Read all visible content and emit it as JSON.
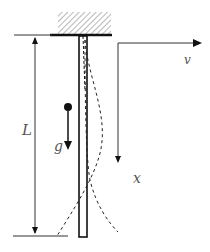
{
  "diagram": {
    "labels": {
      "length": "L",
      "gravity": "g",
      "flow_velocity": "v",
      "axial_coordinate": "x"
    },
    "elements": {
      "support": "hatched fixed clamp at top",
      "beam": "vertical slender beam",
      "mode_shapes": "two dashed deflection curves",
      "mass_point": "filled dot with gravity arrow"
    },
    "colors": {
      "line": "#111111",
      "hatch": "#888888",
      "label": "#555555"
    }
  }
}
